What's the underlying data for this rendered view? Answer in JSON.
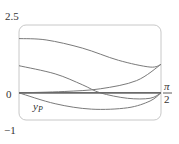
{
  "chart_data": {
    "type": "line",
    "title": "",
    "xlabel": "",
    "ylabel": "",
    "xlim": [
      0,
      1.5708
    ],
    "ylim": [
      -1,
      2.5
    ],
    "y_tick_labels": [
      "2.5",
      "0",
      "−1"
    ],
    "x_tick_labels": [
      {
        "numerator": "π",
        "denominator": "2"
      }
    ],
    "grid": false,
    "legend": null,
    "annotations": [
      {
        "text": "y",
        "subscript": "P",
        "x": 0.25,
        "y": -0.5
      }
    ],
    "series": [
      {
        "name": "curve-1",
        "x": [
          0,
          0.3,
          0.7,
          1.1,
          1.45,
          1.5708
        ],
        "values": [
          2.0,
          1.95,
          1.65,
          1.2,
          0.95,
          1.05
        ]
      },
      {
        "name": "curve-2",
        "x": [
          0,
          0.4,
          0.7,
          0.9,
          1.2,
          1.45,
          1.5708
        ],
        "values": [
          1.0,
          0.7,
          0.3,
          0.0,
          -0.2,
          -0.2,
          0.0
        ]
      },
      {
        "name": "curve-3",
        "x": [
          0,
          0.5,
          0.9,
          1.3,
          1.5708
        ],
        "values": [
          0.0,
          0.05,
          0.15,
          0.45,
          1.05
        ]
      },
      {
        "name": "y_P",
        "x": [
          0,
          0.4,
          0.8,
          1.2,
          1.45,
          1.5708
        ],
        "values": [
          0.0,
          -0.4,
          -0.6,
          -0.55,
          -0.3,
          0.0
        ]
      },
      {
        "name": "zero-line",
        "x": [
          0,
          1.5708
        ],
        "values": [
          0,
          0
        ]
      }
    ]
  },
  "labels": {
    "y_top": "2.5",
    "y_zero": "0",
    "y_bottom": "−1",
    "x_right_num": "π",
    "x_right_den": "2",
    "curve_label": "y",
    "curve_label_sub": "P"
  },
  "colors": {
    "curve": "#7a7a7a",
    "zero_line": "#6a6a6a",
    "frame": "#c8c8c8",
    "text": "#333333"
  }
}
